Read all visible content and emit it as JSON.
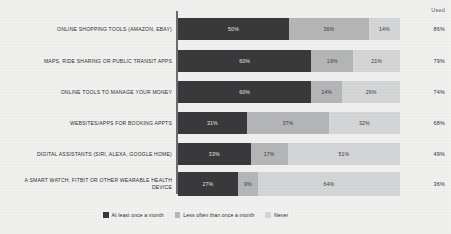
{
  "chart_data": {
    "type": "bar",
    "subtype": "stacked-horizontal-100",
    "title": "",
    "xlabel": "",
    "ylabel": "",
    "grid": false,
    "legend_position": "bottom",
    "xlim": [
      0,
      100
    ],
    "value_suffix": "%",
    "categories": [
      "ONLINE SHOPPING TOOLS (AMAZON, EBAY)",
      "MAPS, RIDE SHARING OR PUBLIC TRANSIT APPS",
      "ONLINE TOOLS TO MANAGE YOUR MONEY",
      "WEBSITES/APPS FOR BOOKING APPTS",
      "DIGITAL ASSISTANTS (SIRI, ALEXA, GOOGLE HOME)",
      "A SMART WATCH, FITBIT OR OTHER WEARABLE HEALTH DEVICE"
    ],
    "series": [
      {
        "name": "At least once a month",
        "color": "#3a3a3c",
        "values": [
          50,
          60,
          60,
          31,
          33,
          27
        ],
        "labels": [
          "50%",
          "60%",
          "60%",
          "31%",
          "33%",
          "27%"
        ]
      },
      {
        "name": "Less often than once a month",
        "color": "#b6b7b9",
        "values": [
          36,
          19,
          14,
          37,
          17,
          9
        ],
        "labels": [
          "36%",
          "19%",
          "14%",
          "37%",
          "17%",
          "9%"
        ]
      },
      {
        "name": "Never",
        "color": "#d6d7d8",
        "values": [
          14,
          21,
          26,
          32,
          51,
          64
        ],
        "labels": [
          "14%",
          "21%",
          "26%",
          "32%",
          "51%",
          "64%"
        ]
      }
    ],
    "annotations": {
      "used_column_header": "Used",
      "used_values": [
        "86%",
        "79%",
        "74%",
        "68%",
        "49%",
        "36%"
      ]
    }
  }
}
